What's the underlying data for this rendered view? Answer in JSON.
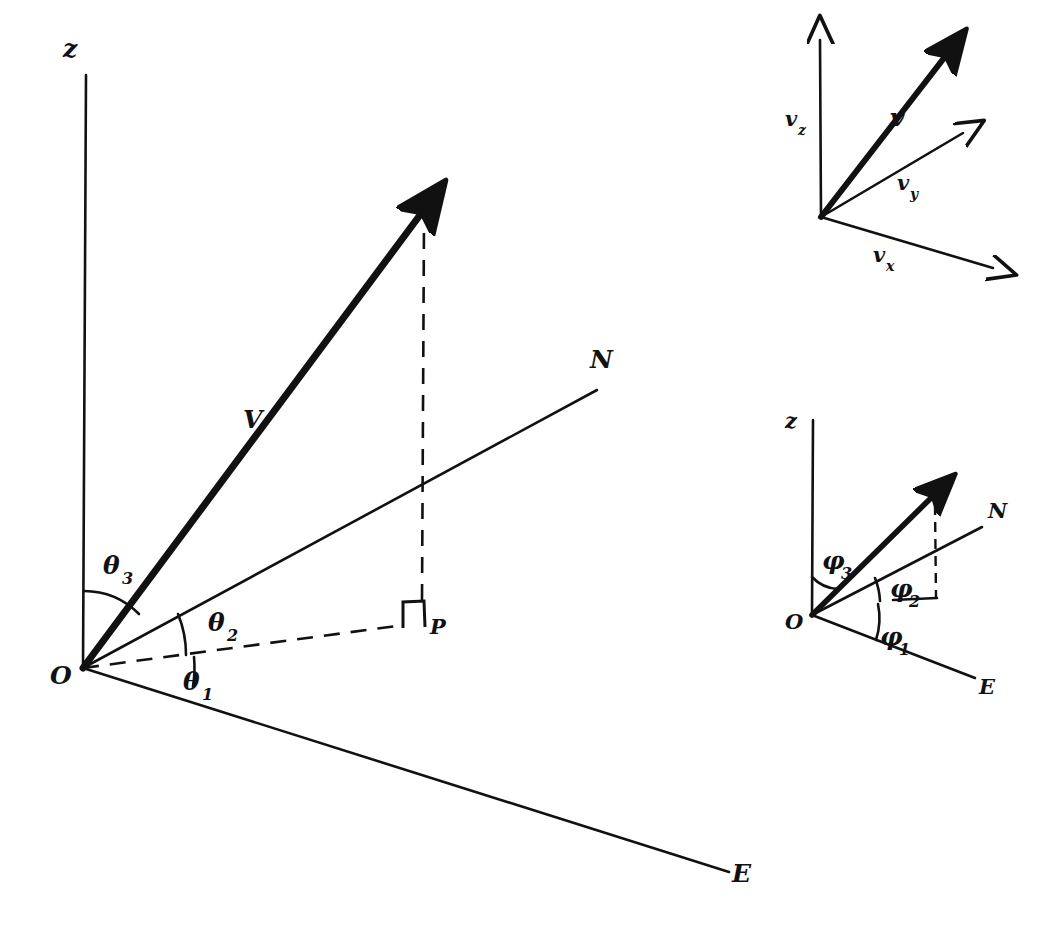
{
  "figure": {
    "kind": "vector-geometry-diagram",
    "background_color": "#ffffff",
    "ink_color": "#111111",
    "main_diagram": {
      "name": "direction-cosines-main",
      "origin_label": "O",
      "axes": [
        {
          "id": "z",
          "label": "z",
          "description": "vertical axis upward from origin"
        },
        {
          "id": "N",
          "label": "N",
          "description": "north horizontal axis up-right from origin"
        },
        {
          "id": "E",
          "label": "E",
          "description": "east horizontal axis down-right from origin"
        }
      ],
      "vector_label": "V",
      "projection_point_label": "P",
      "right_angle_marker": "right-angle",
      "angles": [
        {
          "id": "theta1",
          "symbol": "θ",
          "subscript": "1",
          "between": "E-axis and OP"
        },
        {
          "id": "theta2",
          "symbol": "θ",
          "subscript": "2",
          "between": "OP and N-axis"
        },
        {
          "id": "theta3",
          "symbol": "θ",
          "subscript": "3",
          "between": "z-axis and V"
        }
      ]
    },
    "inset_top": {
      "name": "component-vectors-inset",
      "vector_label": "v",
      "components": [
        {
          "id": "vz",
          "symbol": "v",
          "subscript": "z"
        },
        {
          "id": "vy",
          "symbol": "v",
          "subscript": "y"
        },
        {
          "id": "vx",
          "symbol": "v",
          "subscript": "x"
        }
      ]
    },
    "inset_bottom": {
      "name": "phi-angles-inset",
      "origin_label": "O",
      "axes": [
        {
          "id": "z",
          "label": "z"
        },
        {
          "id": "N",
          "label": "N"
        },
        {
          "id": "E",
          "label": "E"
        }
      ],
      "angles": [
        {
          "id": "phi1",
          "symbol": "φ",
          "subscript": "1"
        },
        {
          "id": "phi2",
          "symbol": "φ",
          "subscript": "2"
        },
        {
          "id": "phi3",
          "symbol": "φ",
          "subscript": "3"
        }
      ]
    }
  },
  "labels": {
    "main_z": "z",
    "main_N": "N",
    "main_E": "E",
    "main_O": "O",
    "main_V": "V",
    "main_P": "P",
    "theta": "θ",
    "theta1_sub": "1",
    "theta2_sub": "2",
    "theta3_sub": "3",
    "inset_top_v": "v",
    "inset_top_vz": "v",
    "inset_top_vz_sub": "z",
    "inset_top_vy": "v",
    "inset_top_vy_sub": "y",
    "inset_top_vx": "v",
    "inset_top_vx_sub": "x",
    "inset_bottom_z": "z",
    "inset_bottom_N": "N",
    "inset_bottom_E": "E",
    "inset_bottom_O": "O",
    "phi": "φ",
    "phi1_sub": "1",
    "phi2_sub": "2",
    "phi3_sub": "3"
  }
}
